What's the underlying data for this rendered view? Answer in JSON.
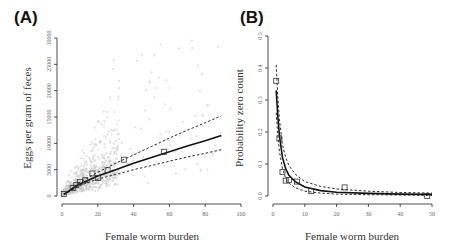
{
  "chart_data": [
    {
      "panel": "(A)",
      "type": "scatter",
      "xlabel": "Female worm burden",
      "ylabel": "Eggs per gram of feces",
      "xlim": [
        0,
        100
      ],
      "ylim": [
        0,
        30000
      ],
      "xticks": [
        0,
        20,
        40,
        60,
        80,
        100
      ],
      "yticks": [
        0,
        5000,
        10000,
        15000,
        20000,
        25000,
        30000
      ],
      "grid": false,
      "series": [
        {
          "name": "binned means",
          "marker": "open-square",
          "x": [
            1,
            6,
            8,
            10,
            13,
            17,
            20,
            25.5,
            34.5,
            57
          ],
          "y": [
            400,
            1500,
            2100,
            2700,
            3000,
            4300,
            3400,
            4900,
            6900,
            8400
          ]
        },
        {
          "name": "fit",
          "style": "solid",
          "x": [
            1,
            10,
            20,
            30,
            40,
            50,
            60,
            70,
            80,
            89
          ],
          "y": [
            300,
            2300,
            3800,
            5000,
            6200,
            7300,
            8400,
            9500,
            10500,
            11500
          ]
        },
        {
          "name": "upper CI",
          "style": "dashed",
          "x": [
            1,
            10,
            20,
            30,
            40,
            50,
            60,
            70,
            80,
            89
          ],
          "y": [
            350,
            2600,
            4500,
            6200,
            7800,
            9400,
            11000,
            12500,
            13900,
            15200
          ]
        },
        {
          "name": "lower CI",
          "style": "dashed",
          "x": [
            1,
            10,
            20,
            30,
            40,
            50,
            60,
            70,
            80,
            89
          ],
          "y": [
            250,
            2000,
            3200,
            4100,
            5000,
            5800,
            6600,
            7400,
            8100,
            8800
          ]
        },
        {
          "name": "raw observations",
          "style": "light-gray points",
          "note": "dense cloud concentrated at 0-30 worms, 0-10000 epg; sparse up to ~90 worms, ~30000 epg"
        }
      ]
    },
    {
      "panel": "(B)",
      "type": "scatter",
      "xlabel": "Female worm burden",
      "ylabel": "Probability zero count",
      "xlim": [
        0,
        50
      ],
      "ylim": [
        0,
        0.5
      ],
      "xticks": [
        0,
        10,
        20,
        30,
        40,
        50
      ],
      "yticks": [
        0.0,
        0.1,
        0.2,
        0.3,
        0.4,
        0.5
      ],
      "grid": false,
      "series": [
        {
          "name": "observed",
          "marker": "open-square",
          "x": [
            1,
            2,
            3,
            4,
            5,
            7.5,
            12,
            22.5,
            48.5
          ],
          "y": [
            0.36,
            0.18,
            0.075,
            0.048,
            0.05,
            0.045,
            0.015,
            0.027,
            0.0
          ]
        },
        {
          "name": "fit",
          "style": "solid",
          "x": [
            1,
            1.5,
            2,
            3,
            4,
            5,
            7,
            10,
            15,
            20,
            30,
            40,
            50
          ],
          "y": [
            0.33,
            0.25,
            0.19,
            0.12,
            0.085,
            0.065,
            0.045,
            0.028,
            0.017,
            0.012,
            0.008,
            0.006,
            0.005
          ]
        },
        {
          "name": "upper CI",
          "style": "dashed",
          "x": [
            1,
            1.5,
            2,
            3,
            4,
            5,
            7,
            10,
            15,
            20,
            30,
            40,
            50
          ],
          "y": [
            0.41,
            0.31,
            0.24,
            0.16,
            0.12,
            0.095,
            0.068,
            0.045,
            0.03,
            0.022,
            0.015,
            0.011,
            0.009
          ]
        },
        {
          "name": "lower CI",
          "style": "dashed",
          "x": [
            1,
            1.5,
            2,
            3,
            4,
            5,
            7,
            10,
            15,
            20,
            30,
            40,
            50
          ],
          "y": [
            0.26,
            0.19,
            0.14,
            0.085,
            0.055,
            0.04,
            0.026,
            0.015,
            0.009,
            0.006,
            0.004,
            0.003,
            0.002
          ]
        }
      ]
    }
  ],
  "labels": {
    "panel_a": "(A)",
    "panel_b": "(B)",
    "a_xlabel": "Female worm burden",
    "a_ylabel": "Eggs per gram of feces",
    "b_xlabel": "Female worm burden",
    "b_ylabel": "Probability zero count"
  },
  "colors": {
    "line": "#111111",
    "points": "#c8c8c8",
    "axis": "#222222",
    "ticklabel": "#666666"
  }
}
